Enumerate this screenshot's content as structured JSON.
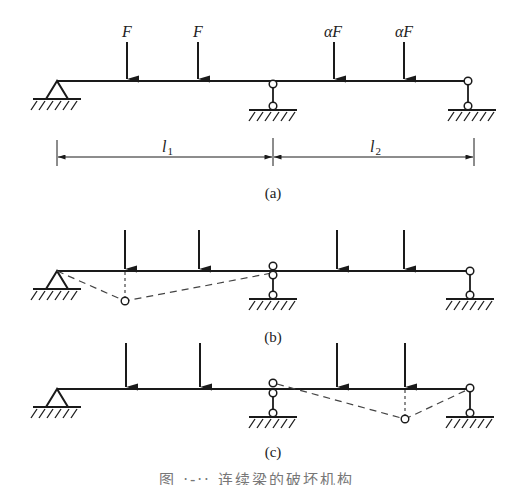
{
  "figure": {
    "caption": "图 ·-·· 连续梁的破坏机构",
    "panels": [
      {
        "id": "a",
        "label": "(a)",
        "loads": [
          {
            "label": "F"
          },
          {
            "label": "F"
          },
          {
            "label": "αF"
          },
          {
            "label": "αF"
          }
        ],
        "dimensions": [
          {
            "label": "l",
            "sub": "1"
          },
          {
            "label": "l",
            "sub": "2"
          }
        ]
      },
      {
        "id": "b",
        "label": "(b)",
        "description": "Mechanism in span 1: plastic hinges under first load and at middle support"
      },
      {
        "id": "c",
        "label": "(c)",
        "description": "Mechanism in span 2: plastic hinges at middle support and under fourth load"
      }
    ]
  },
  "colors": {
    "line": "#1a1a1a",
    "dashed": "#444444",
    "background": "#ffffff"
  }
}
